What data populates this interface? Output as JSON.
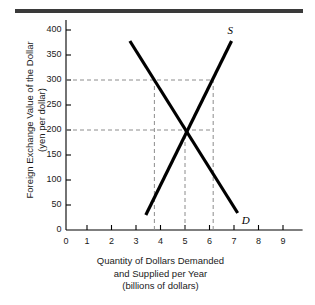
{
  "figure": {
    "top_rule_color": "#3a3a3a",
    "background": "#ffffff",
    "ink_color": "#000000",
    "dash_color": "#8c8c8c"
  },
  "chart_data": {
    "type": "line",
    "title": "",
    "xlabel": "Quantity of Dollars Demanded and Supplied per Year (billions of dollars)",
    "xlabel_lines": [
      "Quantity of Dollars Demanded",
      "and Supplied per Year",
      "(billions of dollars)"
    ],
    "ylabel": "Foreign Exchange Value of the Dollar (yen per dollar)",
    "ylabel_lines": [
      "Foreign Exchange Value of the Dollar",
      "(yen per dollar)"
    ],
    "xlim": [
      0,
      9.8
    ],
    "ylim": [
      0,
      420
    ],
    "xticks": [
      0,
      1,
      2,
      3,
      4,
      5,
      6,
      7,
      8,
      9
    ],
    "xtick_labels": [
      "0",
      "1",
      "2",
      "3",
      "4",
      "5",
      "6",
      "7",
      "8",
      "9"
    ],
    "yticks": [
      0,
      50,
      100,
      150,
      200,
      250,
      300,
      350,
      400
    ],
    "ytick_labels": [
      "0",
      "50",
      "100",
      "150",
      "200",
      "250",
      "300",
      "350",
      "400"
    ],
    "grid": false,
    "legend_position": "inline-curve-labels",
    "series": [
      {
        "name": "D",
        "label": "D",
        "label_text": "D",
        "description": "Demand for dollars, downward sloping",
        "x": [
          2.75,
          7.15
        ],
        "values": [
          378,
          34
        ]
      },
      {
        "name": "S",
        "label": "S",
        "label_text": "S",
        "description": "Supply of dollars, upward sloping",
        "x": [
          3.4,
          6.9
        ],
        "values": [
          30,
          378
        ]
      }
    ],
    "equilibrium": {
      "quantity": 5.0,
      "value": 200
    },
    "annotations": [
      {
        "name": "dashed-price-300",
        "type": "horizontal-dashed",
        "y": 300,
        "x_from": 0,
        "x_to": 6.15
      },
      {
        "name": "dashed-price-200",
        "type": "horizontal-dashed",
        "y": 200,
        "x_from": 0,
        "x_to": 6.15
      },
      {
        "name": "dashed-quantity-demanded-at-300",
        "type": "vertical-dashed",
        "x": 3.75,
        "y_from": 0,
        "y_to": 300
      },
      {
        "name": "dashed-equilibrium-quantity",
        "type": "vertical-dashed",
        "x": 5.0,
        "y_from": 0,
        "y_to": 200
      },
      {
        "name": "dashed-quantity-supplied-at-300",
        "type": "vertical-dashed",
        "x": 6.15,
        "y_from": 0,
        "y_to": 300
      }
    ]
  },
  "labels": {
    "supply_curve": "S",
    "demand_curve": "D"
  }
}
